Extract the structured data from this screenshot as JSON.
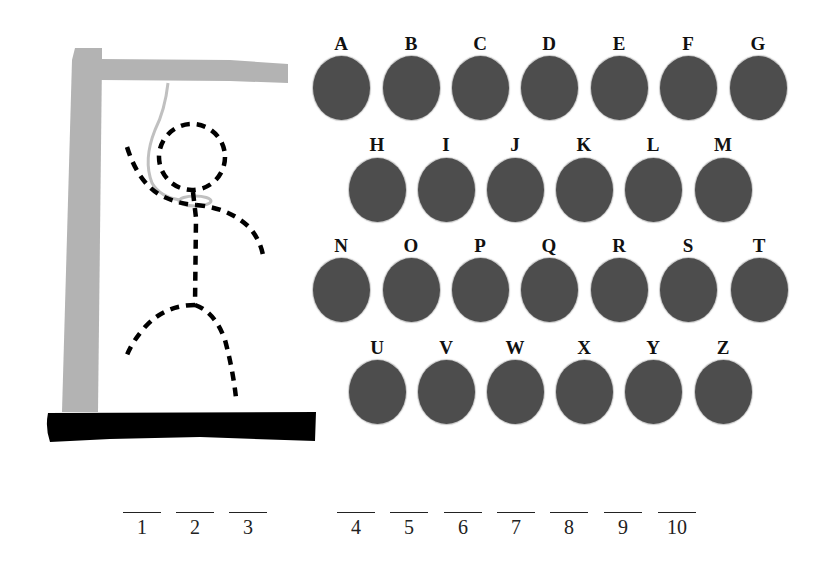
{
  "game": {
    "name": "Hangman",
    "colors": {
      "gallows": "#b3b3b3",
      "base": "#000000",
      "rope": "#c4c4c4",
      "figure": "#000000",
      "key_fill": "#4d4d4d",
      "label": "#111111"
    },
    "figure_parts_drawn": [
      "head",
      "body",
      "left-arm",
      "right-arm",
      "left-leg",
      "right-leg"
    ],
    "keyboard": {
      "rows": [
        {
          "y": 88,
          "label_y": 44,
          "keys": [
            {
              "letter": "A",
              "x": 341
            },
            {
              "letter": "B",
              "x": 411
            },
            {
              "letter": "C",
              "x": 480
            },
            {
              "letter": "D",
              "x": 549
            },
            {
              "letter": "E",
              "x": 619
            },
            {
              "letter": "F",
              "x": 688
            },
            {
              "letter": "G",
              "x": 758
            }
          ]
        },
        {
          "y": 190,
          "label_y": 145,
          "keys": [
            {
              "letter": "H",
              "x": 377
            },
            {
              "letter": "I",
              "x": 446
            },
            {
              "letter": "J",
              "x": 515
            },
            {
              "letter": "K",
              "x": 584
            },
            {
              "letter": "L",
              "x": 653
            },
            {
              "letter": "M",
              "x": 723
            }
          ]
        },
        {
          "y": 290,
          "label_y": 246,
          "keys": [
            {
              "letter": "N",
              "x": 341
            },
            {
              "letter": "O",
              "x": 411
            },
            {
              "letter": "P",
              "x": 480
            },
            {
              "letter": "Q",
              "x": 549
            },
            {
              "letter": "R",
              "x": 619
            },
            {
              "letter": "S",
              "x": 688
            },
            {
              "letter": "T",
              "x": 759
            }
          ]
        },
        {
          "y": 392,
          "label_y": 348,
          "keys": [
            {
              "letter": "U",
              "x": 377
            },
            {
              "letter": "V",
              "x": 446
            },
            {
              "letter": "W",
              "x": 515
            },
            {
              "letter": "X",
              "x": 584
            },
            {
              "letter": "Y",
              "x": 653
            },
            {
              "letter": "Z",
              "x": 723
            }
          ]
        }
      ]
    },
    "word_blanks": [
      {
        "number": "1",
        "x": 142
      },
      {
        "number": "2",
        "x": 195
      },
      {
        "number": "3",
        "x": 248
      },
      {
        "number": "4",
        "x": 356
      },
      {
        "number": "5",
        "x": 409
      },
      {
        "number": "6",
        "x": 463
      },
      {
        "number": "7",
        "x": 516
      },
      {
        "number": "8",
        "x": 569
      },
      {
        "number": "9",
        "x": 623
      },
      {
        "number": "10",
        "x": 677
      }
    ],
    "blank_line_y": 512
  }
}
